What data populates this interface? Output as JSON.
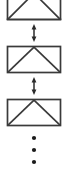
{
  "figure": {
    "type": "technical-diagram",
    "background_color": "#ffffff",
    "stroke_color": "#3a3a3a",
    "dot_color": "#1a1a1a",
    "canvas": {
      "width": 68,
      "height": 175
    },
    "units": [
      {
        "name": "truss-unit-1",
        "label": "",
        "clipped_top": true,
        "x": 7,
        "y": -8,
        "width": 54,
        "height": 28,
        "apex_x": 34
      },
      {
        "name": "truss-unit-2",
        "label": "",
        "clipped_top": false,
        "x": 7,
        "y": 46,
        "width": 54,
        "height": 27,
        "apex_x": 34
      },
      {
        "name": "truss-unit-3",
        "label": "",
        "clipped_top": false,
        "x": 7,
        "y": 99,
        "width": 54,
        "height": 27,
        "apex_x": 34
      }
    ],
    "connectors": [
      {
        "name": "double-arrow-1",
        "label": "",
        "x": 34,
        "y_top": 24,
        "y_bottom": 42
      },
      {
        "name": "double-arrow-2",
        "label": "",
        "x": 34,
        "y_top": 77,
        "y_bottom": 95
      }
    ],
    "ellipsis": {
      "name": "vertical-ellipsis",
      "label": "",
      "x": 34,
      "dot_radius": 2.1,
      "dot_y_positions": [
        138,
        150,
        162
      ]
    }
  }
}
